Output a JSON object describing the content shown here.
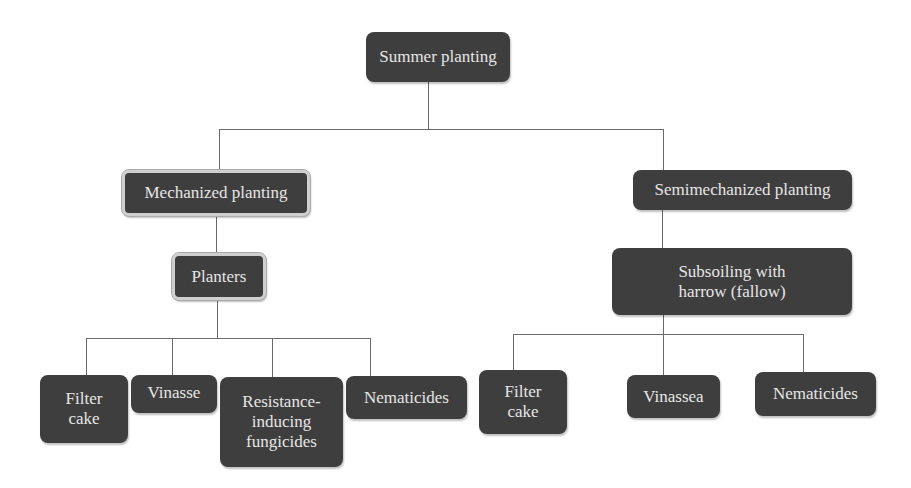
{
  "diagram": {
    "root": {
      "label": "Summer planting"
    },
    "branches": [
      {
        "label": "Mechanized planting",
        "sub": {
          "label": "Planters"
        },
        "children": [
          {
            "label": "Filter\ncake"
          },
          {
            "label": "Vinasse"
          },
          {
            "label": "Resistance-\ninducing\nfungicides"
          },
          {
            "label": "Nematicides"
          }
        ]
      },
      {
        "label": "Semimechanized planting",
        "sub": {
          "label": "Subsoiling with\nharrow (fallow)"
        },
        "children": [
          {
            "label": "Filter\ncake"
          },
          {
            "label": "Vinassea"
          },
          {
            "label": "Nematicides"
          }
        ]
      }
    ]
  },
  "colors": {
    "node_fill": "#3e3e3e",
    "node_text": "#e6e6e6",
    "connector": "#6a6a6a",
    "frame": "#cfcfcf"
  }
}
